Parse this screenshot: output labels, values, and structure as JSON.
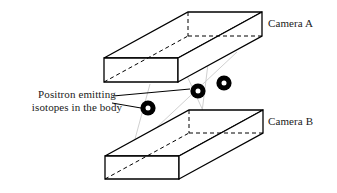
{
  "figure": {
    "background_color": "#ffffff",
    "line_color": "#000000",
    "ray_color": "#cfcfcf",
    "dot_color": "#000000",
    "dot_highlight_color": "#ffffff"
  },
  "labels": {
    "camera_a": "Camera A",
    "camera_b": "Camera B",
    "isotope_line1": "Positron emitting",
    "isotope_line2": "isotopes in the body"
  },
  "detectors": [
    {
      "id": "camera-a",
      "name": "Camera A",
      "position": "top",
      "front_face": {
        "x": 104,
        "y": 58,
        "width": 74,
        "height": 24
      },
      "depth_offset": {
        "dx": 84,
        "dy": -46
      }
    },
    {
      "id": "camera-b",
      "name": "Camera B",
      "position": "bottom",
      "front_face": {
        "x": 105,
        "y": 156,
        "width": 75,
        "height": 23
      },
      "depth_offset": {
        "dx": 84,
        "dy": -46
      }
    }
  ],
  "isotopes": [
    {
      "id": "isotope-1",
      "cx": 198,
      "cy": 91,
      "r": 7.5,
      "inner_r": 2.4
    },
    {
      "id": "isotope-2",
      "cx": 224,
      "cy": 83,
      "r": 7.5,
      "inner_r": 2.4
    },
    {
      "id": "isotope-3",
      "cx": 148,
      "cy": 108,
      "r": 7.5,
      "inner_r": 2.4
    }
  ],
  "leader_lines": [
    {
      "id": "leader-to-isotope-1",
      "x1": 114,
      "y1": 95,
      "x2": 190,
      "y2": 89
    },
    {
      "id": "leader-to-isotope-3",
      "x1": 113,
      "y1": 104,
      "x2": 141,
      "y2": 108
    }
  ],
  "gamma_rays": [
    {
      "id": "ray-1",
      "x1": 173,
      "y1": 55,
      "x2": 215,
      "y2": 150
    },
    {
      "id": "ray-2",
      "x1": 232,
      "y1": 55,
      "x2": 128,
      "y2": 155
    },
    {
      "id": "ray-3",
      "x1": 206,
      "y1": 58,
      "x2": 196,
      "y2": 152
    }
  ]
}
